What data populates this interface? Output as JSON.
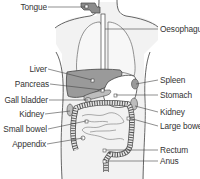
{
  "colors": {
    "body_fill": "#f2f2f2",
    "outline": "#555555",
    "liver_fill": "#9a9a9a",
    "organ_fill": "#bdbdbd",
    "stomach_fill": "#ffffff",
    "leader_line": "#444444",
    "text": "#333333"
  },
  "labels_left": [
    {
      "id": "tongue",
      "text": "Tongue"
    },
    {
      "id": "liver",
      "text": "Liver"
    },
    {
      "id": "pancreas",
      "text": "Pancreas"
    },
    {
      "id": "gall-bladder",
      "text": "Gall bladder"
    },
    {
      "id": "kidney-left",
      "text": "Kidney"
    },
    {
      "id": "small-bowel",
      "text": "Small bowel"
    },
    {
      "id": "appendix",
      "text": "Appendix"
    }
  ],
  "labels_right": [
    {
      "id": "oesophagus",
      "text": "Oesophagus"
    },
    {
      "id": "spleen",
      "text": "Spleen"
    },
    {
      "id": "stomach",
      "text": "Stomach"
    },
    {
      "id": "kidney-right",
      "text": "Kidney"
    },
    {
      "id": "large-bowel",
      "text": "Large bowel"
    },
    {
      "id": "rectum",
      "text": "Rectum"
    },
    {
      "id": "anus",
      "text": "Anus"
    }
  ]
}
